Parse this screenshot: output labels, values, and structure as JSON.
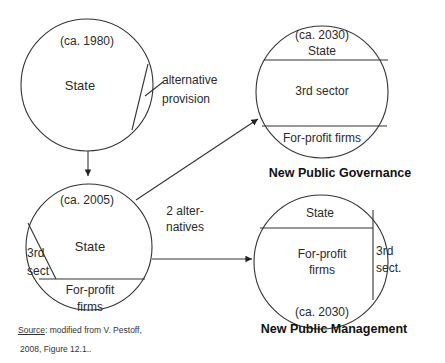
{
  "diagram": {
    "circle_1980": {
      "year": "(ca. 1980)",
      "main": "State",
      "side_label_1": "alternative",
      "side_label_2": "provision"
    },
    "circle_2005": {
      "year": "(ca. 2005)",
      "main": "State",
      "left_1": "3rd",
      "left_2": "sect",
      "bottom_1": "For-profit",
      "bottom_2": "firms"
    },
    "alternatives_label_1": "2 alter-",
    "alternatives_label_2": "natives",
    "circle_npg": {
      "year": "(ca. 2030)",
      "top": "State",
      "middle": "3rd sector",
      "bottom": "For-profit firms",
      "caption": "New Public Governance"
    },
    "circle_npm": {
      "top": "State",
      "middle_1": "For-profit",
      "middle_2": "firms",
      "right_1": "3rd",
      "right_2": "sect.",
      "year": "(ca. 2030)",
      "caption": "New Public Management"
    },
    "source": {
      "label": "Source",
      "text": ": modified from V. Pestoff,",
      "line2": "2008,  Figure 12.1.."
    }
  }
}
